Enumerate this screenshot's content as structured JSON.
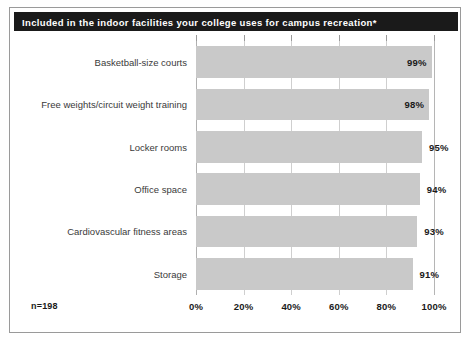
{
  "figure": {
    "title": "Included in the indoor facilities your college uses for campus recreation*",
    "sample_size": "n=198",
    "colors": {
      "title_bar": "#1a1a1a",
      "title_text": "#ffffff",
      "bar_fill": "#c9c9c9",
      "gridline": "#cfcfcf",
      "border": "#9a9a9a",
      "label_text": "#3a3a3a",
      "value_text": "#1a1a1a"
    }
  },
  "chart_data": {
    "type": "bar",
    "orientation": "horizontal",
    "title": "Included in the indoor facilities your college uses for campus recreation*",
    "xlabel": "",
    "ylabel": "",
    "xlim": [
      0,
      100
    ],
    "grid": true,
    "legend": null,
    "note": "n=198",
    "categories": [
      "Basketball-size courts",
      "Free weights/circuit weight training",
      "Locker rooms",
      "Office space",
      "Cardiovascular fitness areas",
      "Storage"
    ],
    "values": [
      99,
      98,
      95,
      94,
      93,
      91
    ],
    "value_labels": [
      "99%",
      "98%",
      "95%",
      "94%",
      "93%",
      "91%"
    ],
    "label_placement": [
      "inside",
      "inside",
      "outside",
      "outside",
      "outside",
      "outside"
    ],
    "xticks": [
      0,
      20,
      40,
      60,
      80,
      100
    ],
    "xtick_labels": [
      "0%",
      "20%",
      "40%",
      "60%",
      "80%",
      "100%"
    ]
  }
}
